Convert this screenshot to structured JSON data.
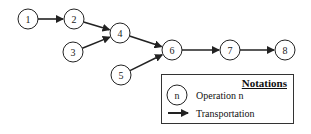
{
  "diagram": {
    "nodes": [
      {
        "id": "1",
        "label": "1",
        "x": 28,
        "y": 19
      },
      {
        "id": "2",
        "label": "2",
        "x": 74,
        "y": 19
      },
      {
        "id": "3",
        "label": "3",
        "x": 73,
        "y": 52
      },
      {
        "id": "4",
        "label": "4",
        "x": 120,
        "y": 33
      },
      {
        "id": "5",
        "label": "5",
        "x": 121,
        "y": 75
      },
      {
        "id": "6",
        "label": "6",
        "x": 172,
        "y": 50
      },
      {
        "id": "7",
        "label": "7",
        "x": 230,
        "y": 50
      },
      {
        "id": "8",
        "label": "8",
        "x": 285,
        "y": 50
      }
    ],
    "edges": [
      {
        "from": "1",
        "to": "2"
      },
      {
        "from": "2",
        "to": "4"
      },
      {
        "from": "3",
        "to": "4"
      },
      {
        "from": "4",
        "to": "6"
      },
      {
        "from": "5",
        "to": "6"
      },
      {
        "from": "6",
        "to": "7"
      },
      {
        "from": "7",
        "to": "8"
      }
    ],
    "colors": {
      "stroke": "#222222",
      "background": "#ffffff"
    }
  },
  "legend": {
    "title": "Notations",
    "operation_symbol": "n",
    "operation_label": "Operation n",
    "transport_label": "Transportation"
  }
}
